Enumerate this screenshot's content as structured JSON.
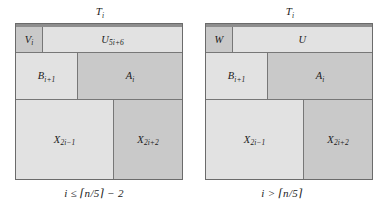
{
  "figure": {
    "background_color": "#ffffff",
    "panels": [
      {
        "id": "left-panel",
        "top_label": "T",
        "top_label_sub": "i",
        "condition": "i ≤ ⌈n/5⌉ − 2",
        "regions": [
          {
            "name": "V",
            "sub": "i",
            "shade": "#c9c9c9",
            "role": "v-region"
          },
          {
            "name": "U",
            "sub": "5i+6",
            "shade": "#e2e2e2",
            "role": "u-region"
          },
          {
            "name": "B",
            "sub": "i+1",
            "shade": "#e2e2e2",
            "role": "b-region"
          },
          {
            "name": "A",
            "sub": "i",
            "shade": "#c9c9c9",
            "role": "a-region"
          },
          {
            "name": "X",
            "sub": "2i−1",
            "shade": "#e2e2e2",
            "role": "x1-region"
          },
          {
            "name": "X",
            "sub": "2i+2",
            "shade": "#c9c9c9",
            "role": "x2-region"
          }
        ]
      },
      {
        "id": "right-panel",
        "top_label": "T",
        "top_label_sub": "i",
        "condition": "i > ⌈n/5⌉",
        "regions": [
          {
            "name": "W",
            "sub": "",
            "shade": "#c9c9c9",
            "role": "w-region"
          },
          {
            "name": "U",
            "sub": "",
            "shade": "#e2e2e2",
            "role": "u-region"
          },
          {
            "name": "B",
            "sub": "i+1",
            "shade": "#e2e2e2",
            "role": "b-region"
          },
          {
            "name": "A",
            "sub": "i",
            "shade": "#c9c9c9",
            "role": "a-region"
          },
          {
            "name": "X",
            "sub": "2i−1",
            "shade": "#e2e2e2",
            "role": "x1-region"
          },
          {
            "name": "X",
            "sub": "2i+2",
            "shade": "#c9c9c9",
            "role": "x2-region"
          }
        ]
      }
    ],
    "colors": {
      "outline": "#6b6b6b",
      "divider": "#777777",
      "cap_strip": "#8e8e8e",
      "shade_light": "#e2e2e2",
      "shade_dark": "#c9c9c9",
      "text": "#1b1b1b"
    }
  }
}
